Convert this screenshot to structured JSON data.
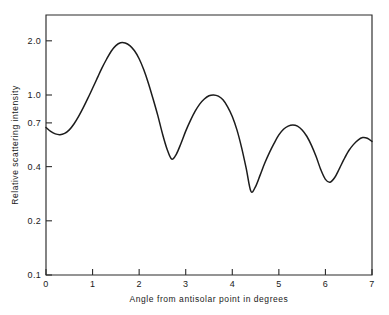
{
  "chart_data": {
    "type": "line",
    "title": "",
    "xlabel": "Angle from antisolar point in degrees",
    "ylabel": "Relative scattering intensity",
    "xlim": [
      0,
      7
    ],
    "ylim": [
      0.1,
      2.4
    ],
    "yscale": "log",
    "xscale": "linear",
    "grid": false,
    "legend": null,
    "xticks": [
      0,
      1,
      2,
      3,
      4,
      5,
      6,
      7
    ],
    "xtick_labels": [
      "0",
      "1",
      "2",
      "3",
      "4",
      "5",
      "6",
      "7"
    ],
    "yticks": [
      2.0,
      1.0,
      0.7,
      0.4,
      0.2,
      0.1
    ],
    "ytick_labels": [
      "2.0",
      "1.0",
      "0.7",
      "0.4",
      "0.2",
      "0.1"
    ],
    "series": [
      {
        "name": "Relative scattering intensity",
        "x": [
          0.0,
          0.1,
          0.2,
          0.3,
          0.4,
          0.5,
          0.6,
          0.7,
          0.8,
          0.9,
          1.0,
          1.1,
          1.2,
          1.3,
          1.4,
          1.5,
          1.6,
          1.7,
          1.8,
          1.9,
          2.0,
          2.1,
          2.2,
          2.3,
          2.4,
          2.5,
          2.6,
          2.7,
          2.8,
          2.9,
          3.0,
          3.1,
          3.2,
          3.3,
          3.4,
          3.5,
          3.6,
          3.7,
          3.8,
          3.9,
          4.0,
          4.1,
          4.2,
          4.3,
          4.4,
          4.5,
          4.6,
          4.7,
          4.8,
          4.9,
          5.0,
          5.1,
          5.2,
          5.3,
          5.4,
          5.5,
          5.6,
          5.7,
          5.8,
          5.9,
          6.0,
          6.1,
          6.2,
          6.3,
          6.4,
          6.5,
          6.6,
          6.7,
          6.8,
          6.9,
          7.0
        ],
        "y": [
          0.66,
          0.628,
          0.608,
          0.602,
          0.612,
          0.64,
          0.69,
          0.76,
          0.85,
          0.96,
          1.09,
          1.24,
          1.41,
          1.58,
          1.75,
          1.88,
          1.95,
          1.945,
          1.88,
          1.76,
          1.59,
          1.38,
          1.16,
          0.95,
          0.77,
          0.61,
          0.5,
          0.44,
          0.47,
          0.54,
          0.63,
          0.72,
          0.81,
          0.89,
          0.95,
          0.99,
          1.0,
          0.985,
          0.94,
          0.86,
          0.76,
          0.64,
          0.51,
          0.39,
          0.292,
          0.31,
          0.36,
          0.42,
          0.48,
          0.54,
          0.6,
          0.645,
          0.672,
          0.682,
          0.672,
          0.64,
          0.59,
          0.525,
          0.455,
          0.385,
          0.34,
          0.328,
          0.348,
          0.39,
          0.44,
          0.49,
          0.53,
          0.562,
          0.58,
          0.575,
          0.552
        ]
      }
    ],
    "annotations": []
  }
}
